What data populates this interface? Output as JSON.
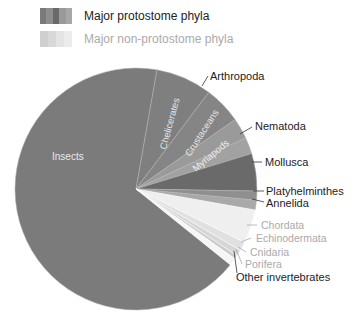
{
  "legend": [
    {
      "label": "Major protostome phyla",
      "color": "#222222",
      "swatch": [
        "#7a7a7a",
        "#8e8e8e",
        "#6a6a6a",
        "#9a9a9a",
        "#a8a8a8"
      ]
    },
    {
      "label": "Major non-protostome phyla",
      "color": "#aaaaaa",
      "swatch": [
        "#cfcfcf",
        "#d8d8d8",
        "#e4e4e4",
        "#ececec"
      ]
    }
  ],
  "chart_data": {
    "type": "pie",
    "title": "",
    "legend_position": "top-left",
    "groups": [
      "Major protostome phyla",
      "Major non-protostome phyla"
    ],
    "slices": [
      {
        "label": "Insects",
        "value": 67.0,
        "group": "Major protostome phyla",
        "parent": "Arthropoda",
        "color": "#7b7b7b"
      },
      {
        "label": "Chelicerates",
        "value": 7.5,
        "group": "Major protostome phyla",
        "parent": "Arthropoda",
        "color": "#7f7f7f"
      },
      {
        "label": "Crustaceans",
        "value": 5.0,
        "group": "Major protostome phyla",
        "parent": "Arthropoda",
        "color": "#858585"
      },
      {
        "label": "Myriapods",
        "value": 2.8,
        "group": "Major protostome phyla",
        "parent": "Arthropoda",
        "color": "#9a9a9a"
      },
      {
        "label": "Nematoda",
        "value": 2.2,
        "group": "Major protostome phyla",
        "color": "#a2a2a2"
      },
      {
        "label": "Mollusca",
        "value": 5.0,
        "group": "Major protostome phyla",
        "color": "#6a6a6a"
      },
      {
        "label": "Platyhelminthes",
        "value": 1.2,
        "group": "Major protostome phyla",
        "color": "#8f8f8f"
      },
      {
        "label": "Annelida",
        "value": 1.3,
        "group": "Major protostome phyla",
        "color": "#a9a9a9"
      },
      {
        "label": "Chordata",
        "value": 4.5,
        "group": "Major non-protostome phyla",
        "color": "#efefef"
      },
      {
        "label": "Echinodermata",
        "value": 1.2,
        "group": "Major non-protostome phyla",
        "color": "#e0e0e0"
      },
      {
        "label": "Cnidaria",
        "value": 0.8,
        "group": "Major non-protostome phyla",
        "color": "#d6d6d6"
      },
      {
        "label": "Porifera",
        "value": 0.5,
        "group": "Major non-protostome phyla",
        "color": "#cccccc"
      },
      {
        "label": "Other invertebrates",
        "value": 1.0,
        "group": "other",
        "color": "#f6f6f6"
      }
    ],
    "group_labels": [
      {
        "label": "Arthropoda",
        "spans": [
          "Insects",
          "Chelicerates",
          "Crustaceans",
          "Myriapods"
        ]
      }
    ]
  },
  "labels": {
    "insects": "Insects",
    "chelicerates": "Chelicerates",
    "crustaceans": "Crustaceans",
    "myriapods": "Myriapods",
    "arthropoda": "Arthropoda",
    "nematoda": "Nematoda",
    "mollusca": "Mollusca",
    "platyhelminthes": "Platyhelminthes",
    "annelida": "Annelida",
    "chordata": "Chordata",
    "echinodermata": "Echinodermata",
    "cnidaria": "Cnidaria",
    "porifera": "Porifera",
    "other": "Other invertebrates"
  }
}
